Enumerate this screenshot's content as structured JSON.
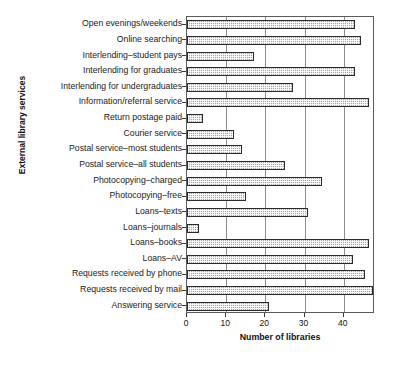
{
  "chart_data": {
    "type": "bar",
    "orientation": "horizontal",
    "title": "",
    "xlabel": "Number of libraries",
    "ylabel": "External library services",
    "xlim": [
      0,
      48
    ],
    "xticks": [
      0,
      10,
      20,
      30,
      40
    ],
    "grid": true,
    "legend": "none",
    "categories": [
      "Open evenings/weekends",
      "Online searching",
      "Interlending–student pays",
      "Interlending for graduates",
      "Interlending for undergraduates",
      "Information/referral service",
      "Return postage paid",
      "Courier service",
      "Postal service–most students",
      "Postal service–all students",
      "Photocopying–charged",
      "Photocopying–free",
      "Loans–texts",
      "Loans–journals",
      "Loans–books",
      "Loans–AV",
      "Requests received by phone",
      "Requests received by mail",
      "Answering service"
    ],
    "values": [
      43,
      44.5,
      17,
      43,
      27,
      46.5,
      4,
      12,
      14,
      25,
      34.5,
      15,
      31,
      3,
      46.5,
      42.5,
      45.5,
      47.5,
      21
    ]
  }
}
